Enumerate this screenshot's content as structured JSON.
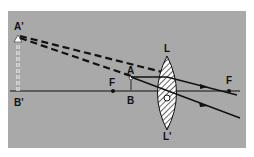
{
  "diagram": {
    "labels": {
      "image_top": "A'",
      "image_bottom": "B'",
      "object_top": "A",
      "object_bottom": "B",
      "focus_left": "F",
      "focus_right": "F",
      "lens_top": "L",
      "lens_bottom": "L'",
      "lens_center": "O"
    },
    "colors": {
      "background": "#a9a9a9",
      "ink": "#111111",
      "image_arrow": "#ffffff"
    }
  }
}
